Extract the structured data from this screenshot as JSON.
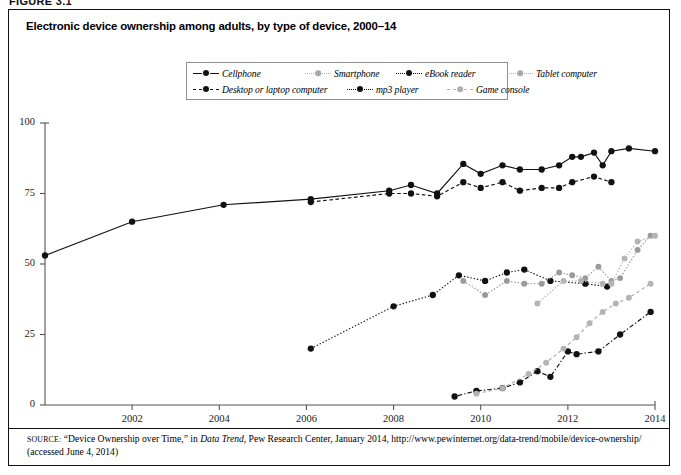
{
  "figure_label": "FIGURE 3.1",
  "title": "Electronic device ownership among adults, by type of device, 2000–14",
  "legend": {
    "rows": [
      [
        {
          "label": "Cellphone",
          "style": "solid-black"
        },
        {
          "label": "Smartphone",
          "style": "dotted-gray"
        },
        {
          "label": "eBook reader",
          "style": "dashdot-black"
        },
        {
          "label": "Tablet computer",
          "style": "dotted-gray"
        }
      ],
      [
        {
          "label": "Desktop or laptop computer",
          "style": "dashed-black"
        },
        {
          "label": "mp3 player",
          "style": "dotted-black"
        },
        {
          "label": "Game console",
          "style": "dashed-gray"
        }
      ]
    ]
  },
  "source": {
    "prefix": "SOURCE:",
    "body_1": "“Device Ownership over Time,” in ",
    "italic_1": "Data Trend",
    "body_2": ", Pew Research Center, January 2014, http://www.pewinternet.org/data-trend/mobile/device-ownership/ (accessed June 4, 2014)"
  },
  "chart_data": {
    "type": "line",
    "title": "Electronic device ownership among adults, by type of device, 2000–14",
    "xlabel": "",
    "ylabel": "",
    "xlim": [
      2000,
      2014
    ],
    "ylim": [
      0,
      100
    ],
    "xticks": [
      2002,
      2004,
      2006,
      2008,
      2010,
      2012,
      2014
    ],
    "yticks": [
      0,
      25,
      50,
      75,
      100
    ],
    "grid": false,
    "legend_position": "top-center",
    "units": "percent of adults",
    "series": [
      {
        "name": "Cellphone",
        "color": "#111111",
        "line": "solid",
        "points": [
          [
            2000.0,
            53
          ],
          [
            2002.0,
            65
          ],
          [
            2004.1,
            71
          ],
          [
            2006.1,
            73
          ],
          [
            2007.9,
            76
          ],
          [
            2008.4,
            78
          ],
          [
            2009.0,
            75
          ],
          [
            2009.6,
            85.5
          ],
          [
            2010.0,
            82
          ],
          [
            2010.5,
            85
          ],
          [
            2010.9,
            83.5
          ],
          [
            2011.4,
            83.5
          ],
          [
            2011.8,
            85
          ],
          [
            2012.1,
            88
          ],
          [
            2012.3,
            88
          ],
          [
            2012.6,
            89.5
          ],
          [
            2012.8,
            85
          ],
          [
            2013.0,
            90
          ],
          [
            2013.4,
            91
          ],
          [
            2014.0,
            90
          ]
        ]
      },
      {
        "name": "Desktop or laptop computer",
        "color": "#111111",
        "line": "dashed",
        "points": [
          [
            2006.1,
            72
          ],
          [
            2007.9,
            75
          ],
          [
            2008.4,
            75
          ],
          [
            2009.0,
            74
          ],
          [
            2009.6,
            79
          ],
          [
            2010.0,
            77
          ],
          [
            2010.5,
            79
          ],
          [
            2010.9,
            76
          ],
          [
            2011.4,
            77
          ],
          [
            2011.8,
            77
          ],
          [
            2012.1,
            79
          ],
          [
            2012.6,
            81
          ],
          [
            2013.0,
            79
          ]
        ]
      },
      {
        "name": "mp3 player",
        "color": "#111111",
        "line": "dotted",
        "points": [
          [
            2006.1,
            20
          ],
          [
            2008.0,
            35
          ],
          [
            2008.9,
            39
          ],
          [
            2009.5,
            46
          ],
          [
            2010.1,
            44
          ],
          [
            2010.6,
            47
          ],
          [
            2011.0,
            48
          ],
          [
            2011.6,
            44
          ],
          [
            2012.4,
            43
          ],
          [
            2012.9,
            42
          ]
        ]
      },
      {
        "name": "eBook reader",
        "color": "#111111",
        "line": "dash-dot",
        "points": [
          [
            2009.4,
            3
          ],
          [
            2009.9,
            5
          ],
          [
            2010.5,
            6
          ],
          [
            2010.9,
            8
          ],
          [
            2011.3,
            12
          ],
          [
            2011.6,
            10
          ],
          [
            2012.0,
            19
          ],
          [
            2012.2,
            18
          ],
          [
            2012.7,
            19
          ],
          [
            2013.2,
            25
          ],
          [
            2013.9,
            33
          ]
        ]
      },
      {
        "name": "Smartphone",
        "color": "#9a9a9a",
        "line": "dotted",
        "points": [
          [
            2009.6,
            44
          ],
          [
            2010.1,
            39
          ],
          [
            2010.6,
            44
          ],
          [
            2011.0,
            43
          ],
          [
            2011.4,
            43
          ],
          [
            2011.8,
            47
          ],
          [
            2012.1,
            46
          ],
          [
            2012.4,
            45
          ],
          [
            2012.7,
            49
          ],
          [
            2013.0,
            44
          ],
          [
            2013.2,
            45
          ],
          [
            2013.6,
            55
          ],
          [
            2013.9,
            60
          ]
        ]
      },
      {
        "name": "Tablet computer",
        "color": "#b4b4b4",
        "line": "dotted",
        "points": [
          [
            2011.3,
            36
          ],
          [
            2011.9,
            44
          ],
          [
            2012.3,
            44
          ],
          [
            2012.8,
            43
          ],
          [
            2013.0,
            43
          ],
          [
            2013.3,
            52
          ],
          [
            2013.6,
            58
          ],
          [
            2014.0,
            60
          ]
        ]
      },
      {
        "name": "Game console",
        "color": "#b4b4b4",
        "line": "dashed",
        "points": [
          [
            2009.9,
            4
          ],
          [
            2010.5,
            6
          ],
          [
            2011.1,
            11
          ],
          [
            2011.5,
            15
          ],
          [
            2011.9,
            20
          ],
          [
            2012.2,
            24
          ],
          [
            2012.5,
            29
          ],
          [
            2012.8,
            33
          ],
          [
            2013.1,
            36
          ],
          [
            2013.4,
            38
          ],
          [
            2013.9,
            43
          ]
        ]
      }
    ]
  }
}
